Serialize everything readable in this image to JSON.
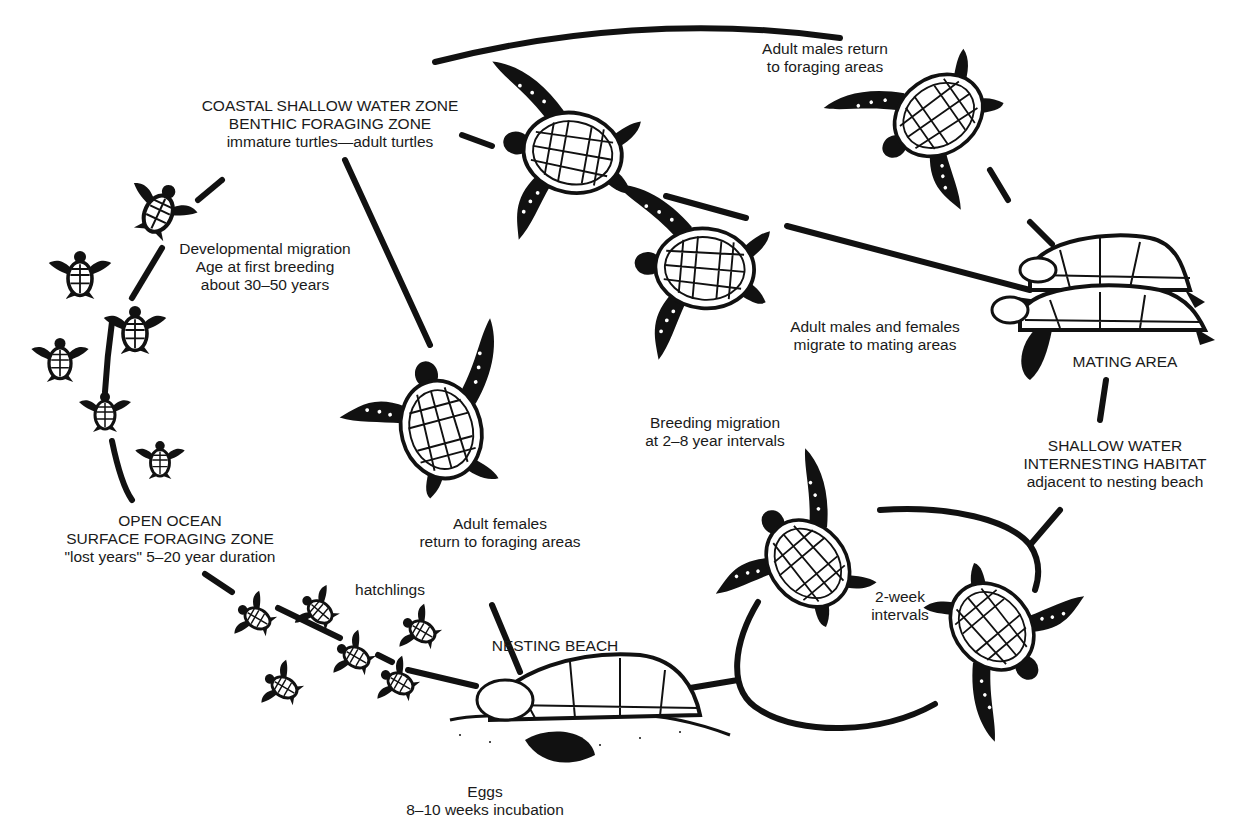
{
  "diagram": {
    "colors": {
      "ink": "#111111",
      "background": "#ffffff",
      "text": "#1a1a1a"
    },
    "labels": {
      "coastal_zone": {
        "line1": "COASTAL SHALLOW WATER ZONE",
        "line2": "BENTHIC FORAGING ZONE",
        "line3": "immature turtles—adult turtles"
      },
      "developmental_migration": {
        "line1": "Developmental migration",
        "line2": "Age at first breeding",
        "line3": "about 30–50 years"
      },
      "males_return": {
        "line1": "Adult males return",
        "line2": "to foraging areas"
      },
      "migrate_to_mating": {
        "line1": "Adult males and females",
        "line2": "migrate to mating areas"
      },
      "mating_area": {
        "line1": "MATING AREA"
      },
      "breeding_migration": {
        "line1": "Breeding migration",
        "line2": "at 2–8 year intervals"
      },
      "internesting": {
        "line1": "SHALLOW WATER",
        "line2": "INTERNESTING HABITAT",
        "line3": "adjacent to nesting beach"
      },
      "open_ocean": {
        "line1": "OPEN OCEAN",
        "line2": "SURFACE FORAGING ZONE",
        "line3": "\"lost years\"  5–20 year duration"
      },
      "females_return": {
        "line1": "Adult females",
        "line2": "return to foraging areas"
      },
      "hatchlings": {
        "line1": "hatchlings"
      },
      "two_week": {
        "line1": "2-week",
        "line2": "intervals"
      },
      "nesting_beach": {
        "line1": "NESTING BEACH"
      },
      "eggs": {
        "line1": "Eggs",
        "line2": "8–10 weeks incubation"
      }
    },
    "stages": [
      "Open ocean surface foraging zone",
      "Coastal shallow water zone",
      "Mating area",
      "Shallow water internesting habitat",
      "Nesting beach"
    ],
    "illustrations": [
      "hatchling-turtles",
      "juvenile-turtles",
      "adult-turtle-swimming",
      "mating-turtles",
      "nesting-turtle-on-beach"
    ]
  }
}
